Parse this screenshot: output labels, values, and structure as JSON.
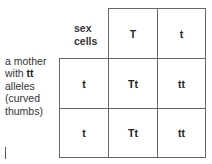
{
  "side_label": {
    "line1": "a mother",
    "line2_prefix": "with ",
    "line2_bold": "tt",
    "line3": "alleles",
    "line4": "(curved",
    "line5": "thumbs)"
  },
  "header_label": {
    "line1": "sex",
    "line2": "cells"
  },
  "columns": [
    "T",
    "t"
  ],
  "rows": [
    {
      "label": "t",
      "cells": [
        "Tt",
        "tt"
      ]
    },
    {
      "label": "t",
      "cells": [
        "Tt",
        "tt"
      ]
    }
  ]
}
